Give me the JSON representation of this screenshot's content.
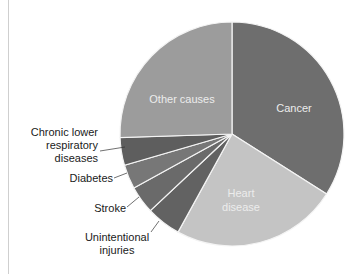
{
  "chart_data": {
    "type": "pie",
    "title": "",
    "center": [
      232,
      134
    ],
    "radius": 112,
    "start_angle_deg": 0,
    "direction": "clockwise",
    "slices": [
      {
        "label": "Cancer",
        "value": 34,
        "color": "#6e6e6e",
        "label_position": "inside"
      },
      {
        "label": "Heart disease",
        "value": 24,
        "color": "#c4c4c4",
        "label_position": "inside"
      },
      {
        "label": "Unintentional injuries",
        "value": 5,
        "color": "#626262",
        "label_position": "outside"
      },
      {
        "label": "Stroke",
        "value": 4,
        "color": "#6a6a6a",
        "label_position": "outside"
      },
      {
        "label": "Diabetes",
        "value": 3.5,
        "color": "#777777",
        "label_position": "outside"
      },
      {
        "label": "Chronic lower respiratory diseases",
        "value": 4,
        "color": "#5e5e5e",
        "label_position": "outside"
      },
      {
        "label": "Other causes",
        "value": 25.5,
        "color": "#9c9c9c",
        "label_position": "inside"
      }
    ],
    "legend": "none (direct labels)"
  },
  "labels": {
    "cancer": "Cancer",
    "heart_1": "Heart",
    "heart_2": "disease",
    "other": "Other causes",
    "clrd_1": "Chronic lower",
    "clrd_2": "respiratory",
    "clrd_3": "diseases",
    "diabetes": "Diabetes",
    "stroke": "Stroke",
    "injuries_1": "Unintentional",
    "injuries_2": "injuries"
  }
}
